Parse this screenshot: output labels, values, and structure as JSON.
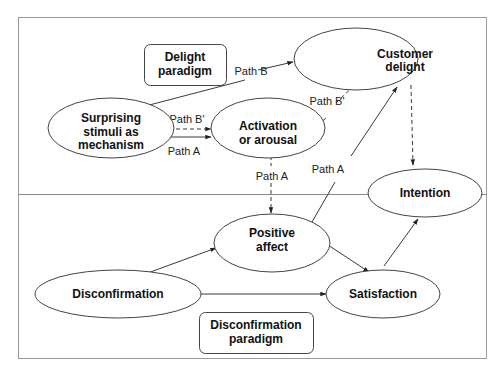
{
  "diagram": {
    "regions": {
      "top": {
        "label_lines": [
          "Delight",
          "paradigm"
        ]
      },
      "bottom": {
        "label_lines": [
          "Disconfirmation",
          "paradigm"
        ]
      }
    },
    "nodes": {
      "surprising": {
        "lines": [
          "Surprising",
          "stimuli as",
          "mechanism"
        ]
      },
      "activation": {
        "lines": [
          "Activation",
          "or arousal"
        ]
      },
      "delight": {
        "lines": [
          "Customer",
          "delight"
        ]
      },
      "intention": {
        "lines": [
          "Intention"
        ]
      },
      "positive": {
        "lines": [
          "Positive",
          "affect"
        ]
      },
      "disconfirmation": {
        "lines": [
          "Disconfirmation"
        ]
      },
      "satisfaction": {
        "lines": [
          "Satisfaction"
        ]
      }
    },
    "edges": [
      {
        "from": "surprising",
        "to": "delight",
        "label": "Path B",
        "style": "solid"
      },
      {
        "from": "surprising",
        "to": "activation",
        "label": "Path B'",
        "style": "dashed"
      },
      {
        "from": "surprising",
        "to": "activation",
        "label": "Path A",
        "style": "solid"
      },
      {
        "from": "activation",
        "to": "delight",
        "label": "Path B'",
        "style": "dashed"
      },
      {
        "from": "activation",
        "to": "positive",
        "label": "Path A",
        "style": "dashed"
      },
      {
        "from": "positive",
        "to": "delight",
        "label": "Path A",
        "style": "solid"
      },
      {
        "from": "delight",
        "to": "intention",
        "label": "",
        "style": "dashed"
      },
      {
        "from": "disconfirmation",
        "to": "positive",
        "label": "",
        "style": "solid"
      },
      {
        "from": "disconfirmation",
        "to": "satisfaction",
        "label": "",
        "style": "solid"
      },
      {
        "from": "positive",
        "to": "satisfaction",
        "label": "",
        "style": "solid"
      },
      {
        "from": "satisfaction",
        "to": "intention",
        "label": "",
        "style": "solid"
      }
    ]
  }
}
